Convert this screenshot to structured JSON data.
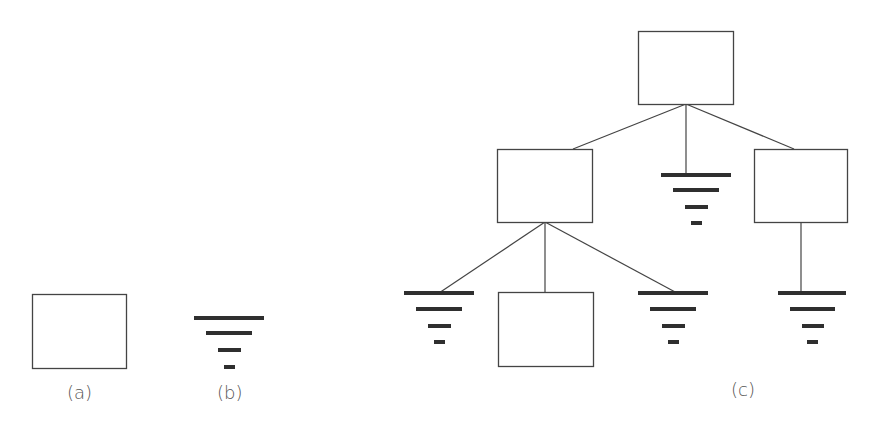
{
  "colors": {
    "stroke": "#444444",
    "ground_bar": "#2f2f2f",
    "label": "#555555",
    "background": "#ffffff"
  },
  "labels": {
    "a": "(a)",
    "b": "(b)",
    "c": "(c)"
  },
  "diagram": {
    "panel_a": {
      "type": "box",
      "description": "single node box"
    },
    "panel_b": {
      "type": "ground-symbol",
      "bars": 4
    },
    "panel_c": {
      "type": "tree",
      "nodes": [
        {
          "id": "root",
          "kind": "box",
          "children": [
            "left",
            "ground-mid",
            "right"
          ]
        },
        {
          "id": "left",
          "kind": "box",
          "children": [
            "ground-ll",
            "leaf-box",
            "ground-lr"
          ]
        },
        {
          "id": "ground-mid",
          "kind": "ground",
          "children": []
        },
        {
          "id": "right",
          "kind": "box",
          "children": [
            "ground-rr"
          ]
        },
        {
          "id": "ground-ll",
          "kind": "ground",
          "children": []
        },
        {
          "id": "leaf-box",
          "kind": "box",
          "children": []
        },
        {
          "id": "ground-lr",
          "kind": "ground",
          "children": []
        },
        {
          "id": "ground-rr",
          "kind": "ground",
          "children": []
        }
      ]
    }
  }
}
